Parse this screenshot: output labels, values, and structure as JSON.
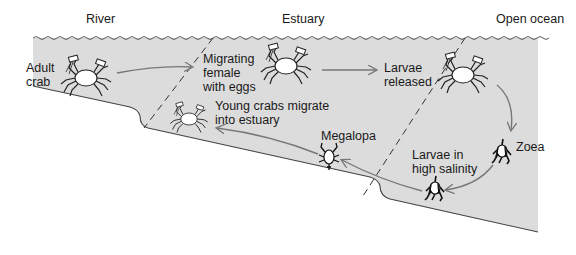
{
  "zones": {
    "river": "River",
    "estuary": "Estuary",
    "ocean": "Open ocean"
  },
  "stages": {
    "adult": "Adult\ncrab",
    "female": "Migrating\nfemale\nwith eggs",
    "released": "Larvae\nreleased",
    "zoea": "Zoea",
    "salinity": "Larvae in\nhigh salinity",
    "megalopa": "Megalopa",
    "young": "Young crabs migrate\ninto estuary"
  },
  "colors": {
    "water": "#dcdcdc",
    "outline": "#333333",
    "arrow": "#777777",
    "text": "#1a1a1a"
  },
  "icons": {
    "adult": "crab-icon",
    "female": "crab-icon",
    "released": "crab-icon",
    "young": "crab-icon",
    "megalopa": "megalopa-larva-icon",
    "zoea": "zoea-larva-icon",
    "salinity": "zoea-larva-icon"
  }
}
